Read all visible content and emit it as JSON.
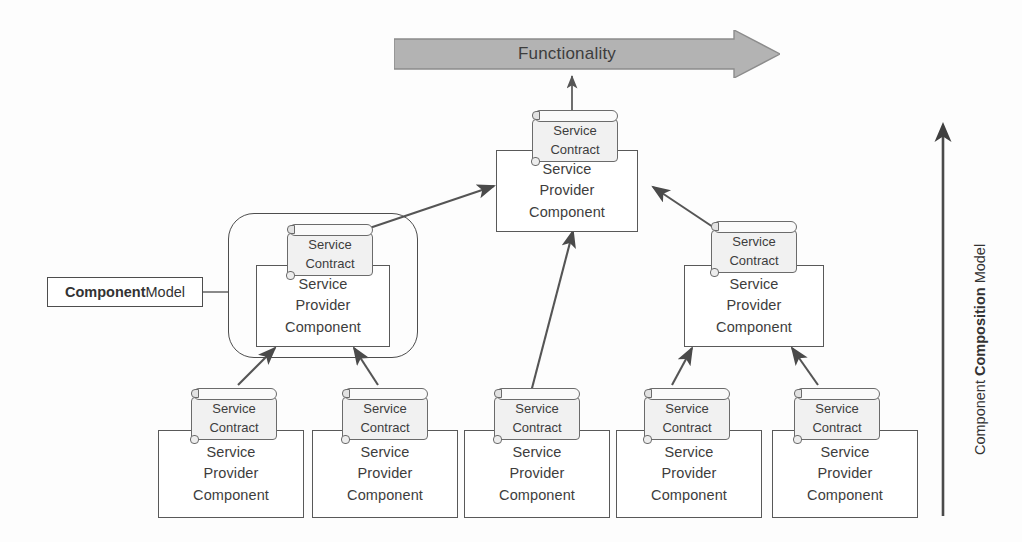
{
  "diagram": {
    "title_banner": "Functionality",
    "left_label": {
      "bold": "Component",
      "rest": " Model"
    },
    "right_label": {
      "pre": "Component ",
      "bold": "Composition",
      "post": " Model"
    },
    "contract_label": {
      "line1": "Service",
      "line2": "Contract"
    },
    "component_label": {
      "line1": "Service",
      "line2": "Provider",
      "line3": "Component"
    },
    "colors": {
      "banner_fill": "#b3b3b3",
      "banner_stroke": "#8c8c8c",
      "contract_fill": "#f1f1f1",
      "contract_stroke": "#6b6b6b",
      "component_stroke": "#595959",
      "arrow_stroke": "#555555",
      "text": "#3d3d3d",
      "background": "#fdfdfd"
    },
    "tiers": [
      {
        "name": "top-tier",
        "nodes": [
          {
            "id": "top-center",
            "contract": "Service Contract",
            "component": "Service Provider Component"
          }
        ]
      },
      {
        "name": "middle-tier",
        "nodes": [
          {
            "id": "mid-left",
            "contract": "Service Contract",
            "component": "Service Provider Component",
            "in_model_container": true
          },
          {
            "id": "mid-right",
            "contract": "Service Contract",
            "component": "Service Provider Component",
            "in_model_container": false
          }
        ]
      },
      {
        "name": "bottom-tier",
        "nodes": [
          {
            "id": "bottom-1",
            "contract": "Service Contract",
            "component": "Service Provider Component"
          },
          {
            "id": "bottom-2",
            "contract": "Service Contract",
            "component": "Service Provider Component"
          },
          {
            "id": "bottom-3",
            "contract": "Service Contract",
            "component": "Service Provider Component"
          },
          {
            "id": "bottom-4",
            "contract": "Service Contract",
            "component": "Service Provider Component"
          },
          {
            "id": "bottom-5",
            "contract": "Service Contract",
            "component": "Service Provider Component"
          }
        ]
      }
    ],
    "connections": [
      {
        "from": "mid-left",
        "to": "top-center",
        "style": "arrow"
      },
      {
        "from": "mid-right",
        "to": "top-center",
        "style": "arrow"
      },
      {
        "from": "bottom-3",
        "to": "top-center",
        "style": "arrow"
      },
      {
        "from": "bottom-1",
        "to": "mid-left",
        "style": "arrow"
      },
      {
        "from": "bottom-2",
        "to": "mid-left",
        "style": "arrow"
      },
      {
        "from": "bottom-4",
        "to": "mid-right",
        "style": "arrow"
      },
      {
        "from": "bottom-5",
        "to": "mid-right",
        "style": "arrow"
      },
      {
        "from": "top-center",
        "to": "title_banner",
        "style": "arrow"
      }
    ]
  }
}
